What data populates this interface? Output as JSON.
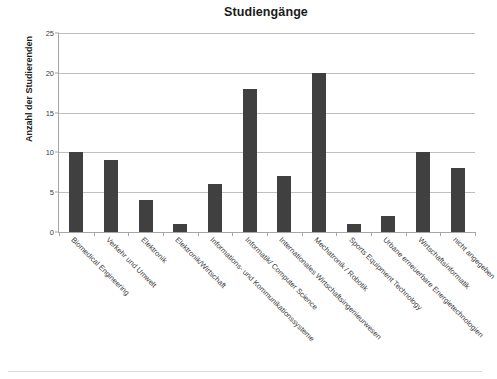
{
  "chart_data": {
    "type": "bar",
    "title": "Studiengänge",
    "xlabel": "",
    "ylabel": "Anzahl der Studierenden",
    "ylim": [
      0,
      25
    ],
    "ytick_step": 5,
    "yticks": [
      0,
      5,
      10,
      15,
      20,
      25
    ],
    "grid": true,
    "legend": "none",
    "bar_color": "#404040",
    "gridline_color": "#bfbfbf",
    "axis_color": "#a6a6a6",
    "categories": [
      "Biomedical Engineering",
      "Verkehr und Umwelt",
      "Elektronik",
      "Elektronik/Wirtschaft",
      "Informations- und Kommunikationssysteme",
      "Informatik/ Computer Science",
      "Internationales Wirtschaftsingenieurwesen",
      "Mechatronik / Robotik",
      "Sports Equipment Technology",
      "Urbane erneuerbare Energietechnologien",
      "Wirtschaftsinformatik",
      "nicht angegeben"
    ],
    "values": [
      10,
      9,
      4,
      1,
      6,
      18,
      7,
      20,
      1,
      2,
      10,
      8
    ]
  }
}
